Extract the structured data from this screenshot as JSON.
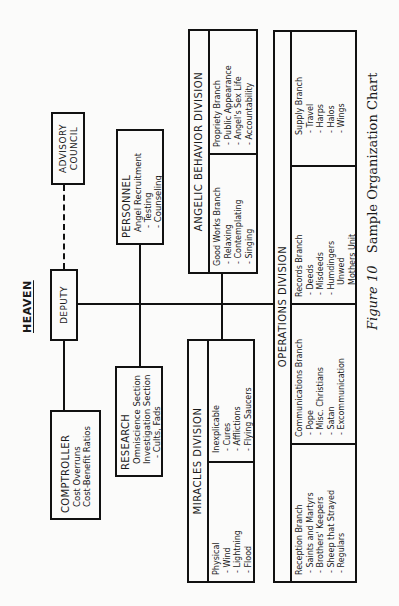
{
  "title": "HEAVEN",
  "caption": {
    "figure": "Figure 10",
    "text": "Sample Organization Chart"
  },
  "advisory": {
    "line1": "ADVISORY",
    "line2": "COUNCIL"
  },
  "deputy": {
    "label": "DEPUTY"
  },
  "comptroller": {
    "head": "COMPTROLLER",
    "items": [
      "Cost Overruns",
      "Cost-Benefit Ratios"
    ]
  },
  "personnel": {
    "head": "PERSONNEL",
    "items": [
      "Angel Recruitment",
      "- Testing",
      "- Counseling"
    ]
  },
  "research": {
    "head": "RESEARCH",
    "items": [
      "Omniscience Section",
      "Investigation Section",
      "- Cults, Fads"
    ]
  },
  "angelic": {
    "title": "ANGELIC BEHAVIOR DIVISION",
    "branches": [
      {
        "head": "Good Works Branch",
        "items": [
          "- Relaxing",
          "- Contemplating",
          "- Singing"
        ]
      },
      {
        "head": "Propriety Branch",
        "items": [
          "- Public Appearance",
          "- Angel's Sex Life",
          "- Accountability"
        ]
      }
    ]
  },
  "miracles": {
    "title": "MIRACLES DIVISION",
    "branches": [
      {
        "head": "Physical",
        "items": [
          "- Wind",
          "- Lightning",
          "- Flood"
        ]
      },
      {
        "head": "Inexplicable",
        "items": [
          "- Cures",
          "- Afflictions",
          "- Flying Saucers"
        ]
      }
    ]
  },
  "operations": {
    "title": "OPERATIONS DIVISION",
    "branches": [
      {
        "head": "Reception Branch",
        "items": [
          "- Saints and Martyrs",
          "- Brothers' Keepers",
          "- Sheep that Strayed",
          "- Regulars"
        ]
      },
      {
        "head": "Communications Branch",
        "items": [
          "- Pope",
          "- Misc. Christians",
          "- Satan",
          "- Excommunication"
        ]
      },
      {
        "head": "Records Branch",
        "items": [
          "- Deeds",
          "- Misdeeds",
          "- Humdingers",
          "  Unwed",
          "  Mothers Unit"
        ]
      },
      {
        "head": "Supply Branch",
        "items": [
          "- Travel",
          "- Harps",
          "- Halos",
          "- Wings"
        ]
      }
    ]
  }
}
